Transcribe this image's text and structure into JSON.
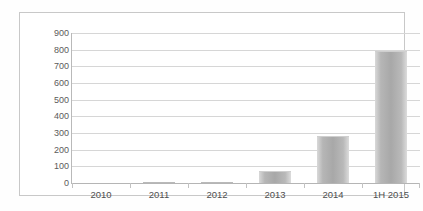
{
  "chart_data": {
    "type": "bar",
    "title": "",
    "subtitle": "",
    "xlabel": "",
    "ylabel": "",
    "categories": [
      "2010",
      "2011",
      "2012",
      "2013",
      "2014",
      "1H 2015"
    ],
    "values": [
      0,
      5,
      5,
      75,
      280,
      790
    ],
    "series": [
      {
        "name": "",
        "values": [
          0,
          5,
          5,
          75,
          280,
          790
        ]
      }
    ],
    "ylim": [
      0,
      900
    ],
    "ytick_values": [
      0,
      100,
      200,
      300,
      400,
      500,
      600,
      700,
      800,
      900
    ],
    "ytick_labels": [
      "0",
      "100",
      "200",
      "300",
      "400",
      "500",
      "600",
      "700",
      "800",
      "900"
    ],
    "grid": true,
    "grid_axis": "y",
    "legend": false,
    "legend_position": "none",
    "bar_color": "#aeaeae",
    "gridline_color": "#d6d6d6",
    "axis_color": "#b9b9b9",
    "label_color": "#555555",
    "frame_color": "#c8c8c8",
    "background_color": "#ffffff"
  }
}
